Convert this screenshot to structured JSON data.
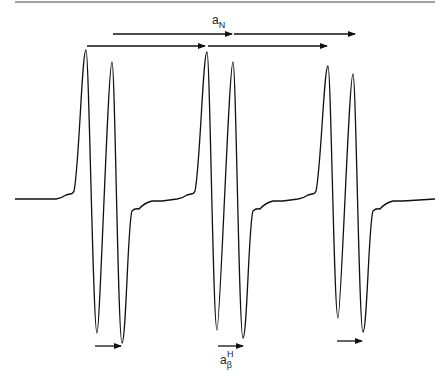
{
  "figure": {
    "type": "EPR spectrum",
    "labels": {
      "coupling_n": {
        "base": "a",
        "sub": "N"
      },
      "coupling_h": {
        "base": "a",
        "sup": "H",
        "sub": "β"
      }
    },
    "colors": {
      "line": "#111111",
      "background": "#ffffff"
    }
  },
  "spectrum": {
    "baseline_y": 199,
    "groups": [
      {
        "peaks": [
          [
            86,
            50
          ],
          [
            112,
            62
          ]
        ],
        "troughs": [
          [
            97,
            333
          ],
          [
            122,
            343
          ]
        ]
      },
      {
        "peaks": [
          [
            207,
            52
          ],
          [
            233,
            62
          ]
        ],
        "troughs": [
          [
            217,
            330
          ],
          [
            243,
            338
          ]
        ]
      },
      {
        "peaks": [
          [
            328,
            66
          ],
          [
            353,
            74
          ]
        ],
        "troughs": [
          [
            338,
            318
          ],
          [
            363,
            332
          ]
        ]
      }
    ]
  },
  "arrows": {
    "aN_row1": [
      [
        87,
        46,
        205
      ],
      [
        208,
        46,
        327
      ]
    ],
    "aN_row2": [
      [
        113,
        34,
        232
      ],
      [
        234,
        34,
        355
      ]
    ],
    "aH": [
      [
        95,
        346,
        121
      ],
      [
        218,
        346,
        243
      ],
      [
        337,
        341,
        362
      ]
    ]
  }
}
